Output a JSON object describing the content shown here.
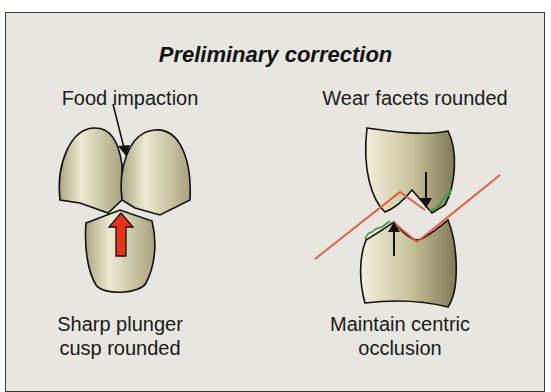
{
  "title": "Preliminary correction",
  "left_panel": {
    "top_label": "Food impaction",
    "bottom_label_line1": "Sharp plunger",
    "bottom_label_line2": "cusp rounded"
  },
  "right_panel": {
    "top_label": "Wear facets rounded",
    "bottom_label_line1": "Maintain centric",
    "bottom_label_line2": "occlusion"
  },
  "colors": {
    "background": "#e8e6e1",
    "tooth_fill": "#d8d4b0",
    "plunger_arrow": "#e8321c",
    "occlusal_line": "#e8573a",
    "facet_bracket": "#3a9a3a",
    "outline": "#111111"
  }
}
